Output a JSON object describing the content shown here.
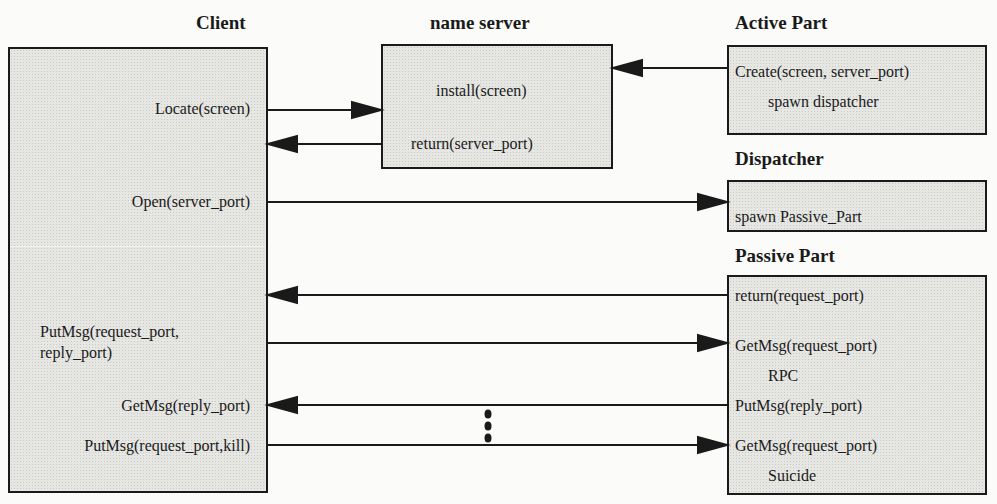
{
  "participants": {
    "client": {
      "title": "Client",
      "labels": {
        "locate": "Locate(screen)",
        "open": "Open(server_port)",
        "putmsg_req_1": "PutMsg(request_port,",
        "putmsg_req_2": "reply_port)",
        "getmsg_reply": "GetMsg(reply_port)",
        "putmsg_kill": "PutMsg(request_port,kill)"
      }
    },
    "name_server": {
      "title": "name server",
      "labels": {
        "install": "install(screen)",
        "return": "return(server_port)"
      }
    },
    "active_part": {
      "title": "Active Part",
      "labels": {
        "create": "Create(screen, server_port)",
        "spawn": "spawn dispatcher"
      }
    },
    "dispatcher": {
      "title": "Dispatcher",
      "labels": {
        "spawn": "spawn Passive_Part"
      }
    },
    "passive_part": {
      "title": "Passive Part",
      "labels": {
        "return": "return(request_port)",
        "getmsg_1": "GetMsg(request_port)",
        "rpc": "RPC",
        "putmsg": "PutMsg(reply_port)",
        "getmsg_2": "GetMsg(request_port)",
        "suicide": "Suicide"
      }
    }
  },
  "messages": [
    {
      "from": "active_part",
      "to": "name_server",
      "y": 68
    },
    {
      "from": "client",
      "to": "name_server",
      "y": 110
    },
    {
      "from": "name_server",
      "to": "client",
      "y": 144
    },
    {
      "from": "client",
      "to": "dispatcher",
      "y": 202
    },
    {
      "from": "passive_part",
      "to": "client",
      "y": 295
    },
    {
      "from": "client",
      "to": "passive_part",
      "y": 343
    },
    {
      "from": "passive_part",
      "to": "client",
      "y": 405
    },
    {
      "from": "client",
      "to": "passive_part",
      "y": 445
    }
  ],
  "ellipsis": "⋮",
  "colors": {
    "line": "#1a1a1a",
    "box_fill": "#e6e6e3"
  }
}
